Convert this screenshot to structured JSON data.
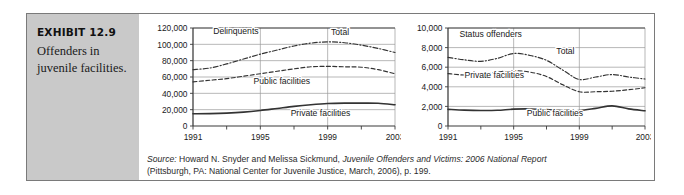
{
  "exhibit": {
    "number": "EXHIBIT 12.9",
    "title": "Offenders in juvenile facilities."
  },
  "source": {
    "label": "Source:",
    "line1_pre": " Howard N. Snyder and Melissa Sickmund, ",
    "line1_italic": "Juvenile Offenders and Victims: 2006 National Report",
    "line2": "(Pittsburgh, PA: National Center for Juvenile Justice, March, 2006), p. 199."
  },
  "colors": {
    "panel_bg": "#c9c9c9",
    "frame": "#7a7a7a",
    "grid": "#9a9a9a",
    "axis": "#3a3a3a",
    "line": "#333333",
    "text": "#1a1a1a"
  },
  "chart_data": [
    {
      "type": "line",
      "title": "Delinquents",
      "xlabel": "",
      "ylabel": "",
      "x": [
        1991,
        1992,
        1993,
        1994,
        1995,
        1996,
        1997,
        1998,
        1999,
        2000,
        2001,
        2002,
        2003
      ],
      "xticks": [
        1991,
        1993,
        1995,
        1997,
        1999,
        2001,
        2003
      ],
      "xticklabels": [
        "1991",
        "",
        "1995",
        "",
        "1999",
        "",
        "2003"
      ],
      "yticks": [
        0,
        20000,
        40000,
        60000,
        80000,
        100000,
        120000
      ],
      "yticklabels": [
        "0",
        "20,000",
        "40,000",
        "60,000",
        "80,000",
        "100,000",
        "120,000"
      ],
      "ylim": [
        0,
        120000
      ],
      "xlim": [
        1991,
        2003
      ],
      "grid": true,
      "annotations": [
        {
          "text": "Delinquents",
          "x": 1992.2,
          "y": 113000
        },
        {
          "text": "Total",
          "x": 1999.2,
          "y": 112000
        },
        {
          "text": "Public facilities",
          "x": 1994.6,
          "y": 52000
        },
        {
          "text": "Private facilities",
          "x": 1996.8,
          "y": 12000
        }
      ],
      "series": [
        {
          "name": "Total",
          "style": "dash-dot",
          "values": [
            69000,
            71000,
            76000,
            82000,
            88000,
            93000,
            98000,
            101500,
            103000,
            102000,
            99000,
            95000,
            90000
          ]
        },
        {
          "name": "Public facilities",
          "style": "dashed",
          "values": [
            54000,
            56000,
            58000,
            61000,
            64000,
            67000,
            70000,
            72500,
            73000,
            72500,
            72000,
            69000,
            64000
          ]
        },
        {
          "name": "Private facilities",
          "style": "solid",
          "values": [
            15000,
            15200,
            15800,
            17000,
            19000,
            21500,
            24000,
            26000,
            27500,
            28000,
            28000,
            27800,
            26000
          ]
        }
      ]
    },
    {
      "type": "line",
      "title": "Status offenders",
      "xlabel": "",
      "ylabel": "",
      "x": [
        1991,
        1992,
        1993,
        1994,
        1995,
        1996,
        1997,
        1998,
        1999,
        2000,
        2001,
        2002,
        2003
      ],
      "xticks": [
        1991,
        1993,
        1995,
        1997,
        1999,
        2001,
        2003
      ],
      "xticklabels": [
        "1991",
        "",
        "1995",
        "",
        "1999",
        "",
        "2003"
      ],
      "yticks": [
        0,
        2000,
        4000,
        6000,
        8000,
        10000
      ],
      "yticklabels": [
        "0",
        "2,000",
        "4,000",
        "6,000",
        "8,000",
        "10,000"
      ],
      "ylim": [
        0,
        10000
      ],
      "xlim": [
        1991,
        2003
      ],
      "grid": true,
      "annotations": [
        {
          "text": "Status offenders",
          "x": 1991.7,
          "y": 9100
        },
        {
          "text": "Total",
          "x": 1997.6,
          "y": 7350
        },
        {
          "text": "Private facilities",
          "x": 1992.0,
          "y": 4900
        },
        {
          "text": "Public facilities",
          "x": 1995.8,
          "y": 1000
        }
      ],
      "series": [
        {
          "name": "Total",
          "style": "dash-dot",
          "values": [
            7000,
            6750,
            6600,
            6900,
            7400,
            7200,
            6700,
            5700,
            4750,
            5000,
            5250,
            5000,
            4800
          ]
        },
        {
          "name": "Private facilities",
          "style": "dashed",
          "values": [
            5350,
            5200,
            5250,
            5500,
            5650,
            5500,
            5050,
            4200,
            3500,
            3500,
            3550,
            3700,
            3900
          ]
        },
        {
          "name": "Public facilities",
          "style": "solid",
          "values": [
            1700,
            1620,
            1580,
            1600,
            1720,
            1740,
            1680,
            1580,
            1580,
            1800,
            2050,
            1750,
            1550
          ]
        }
      ]
    }
  ]
}
